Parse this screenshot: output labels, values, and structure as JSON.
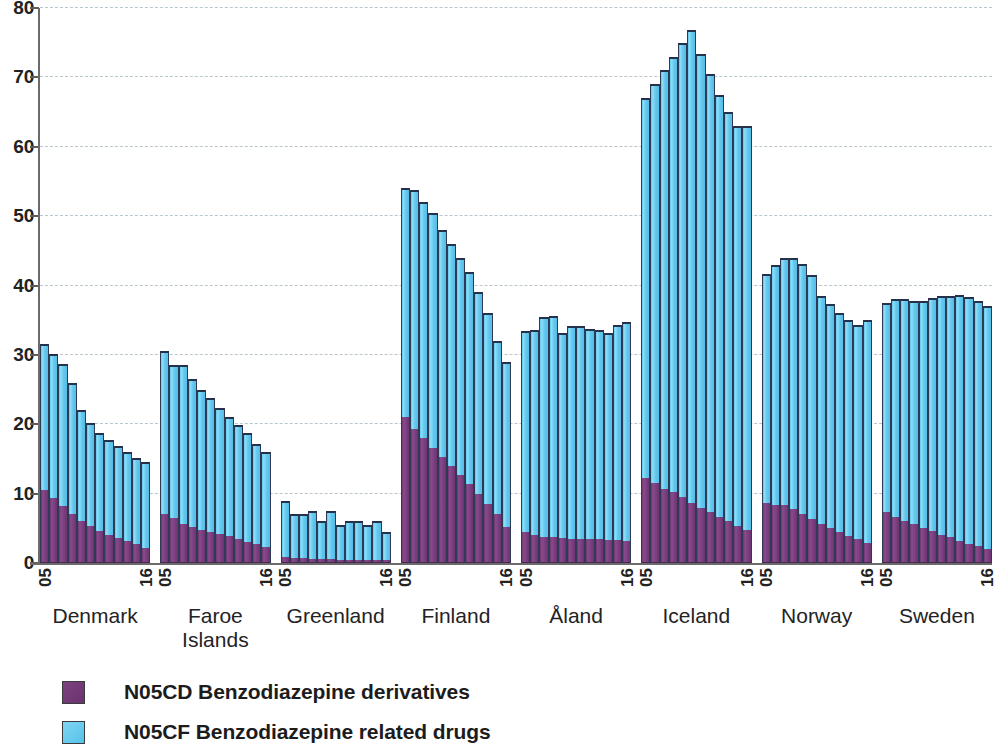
{
  "chart_data": {
    "type": "bar",
    "stacked": true,
    "title": "",
    "subtitle": "",
    "xlabel": "",
    "ylabel": "",
    "ylim": [
      0,
      80
    ],
    "yticks": [
      0,
      10,
      20,
      30,
      40,
      50,
      60,
      70,
      80
    ],
    "ytick_labels": [
      "0",
      "10",
      "20",
      "30",
      "40",
      "50",
      "60",
      "70",
      "80"
    ],
    "grid": true,
    "grid_style": "dashed horizontal",
    "legend_position": "bottom-left",
    "x_tick_labels": [
      "05",
      "16"
    ],
    "years": [
      "05",
      "06",
      "07",
      "08",
      "09",
      "10",
      "11",
      "12",
      "13",
      "14",
      "15",
      "16"
    ],
    "categories": [
      "Denmark",
      "Faroe Islands",
      "Greenland",
      "Finland",
      "Åland",
      "Iceland",
      "Norway",
      "Sweden"
    ],
    "series": [
      {
        "name": "N05CD Benzodiazepine derivatives",
        "color": "#7b3f7e",
        "groups": [
          {
            "category": "Denmark",
            "values": [
              10.5,
              9.4,
              8.2,
              7.0,
              6.0,
              5.3,
              4.6,
              4.1,
              3.6,
              3.2,
              2.7,
              2.2
            ]
          },
          {
            "category": "Faroe Islands",
            "values": [
              7.0,
              6.5,
              5.6,
              5.2,
              4.8,
              4.5,
              4.2,
              3.9,
              3.5,
              3.1,
              2.7,
              2.3
            ]
          },
          {
            "category": "Greenland",
            "values": [
              0.8,
              0.7,
              0.7,
              0.6,
              0.6,
              0.6,
              0.5,
              0.5,
              0.5,
              0.4,
              0.4,
              0.4
            ]
          },
          {
            "category": "Finland",
            "values": [
              21.0,
              19.3,
              18.0,
              16.6,
              15.3,
              14.0,
              12.7,
              11.4,
              10.0,
              8.5,
              7.0,
              5.2
            ]
          },
          {
            "category": "Åland",
            "values": [
              4.4,
              4.0,
              3.8,
              3.7,
              3.6,
              3.5,
              3.5,
              3.4,
              3.4,
              3.3,
              3.3,
              3.2
            ]
          },
          {
            "category": "Iceland",
            "values": [
              12.2,
              11.6,
              10.7,
              10.2,
              9.5,
              8.6,
              8.0,
              7.3,
              6.7,
              6.0,
              5.4,
              4.8
            ]
          },
          {
            "category": "Norway",
            "values": [
              8.6,
              8.4,
              8.4,
              7.8,
              7.0,
              6.3,
              5.6,
              5.0,
              4.4,
              3.9,
              3.4,
              2.9
            ]
          },
          {
            "category": "Sweden",
            "values": [
              7.3,
              6.7,
              6.1,
              5.6,
              5.1,
              4.6,
              4.1,
              3.7,
              3.2,
              2.8,
              2.4,
              2.0
            ]
          }
        ]
      },
      {
        "name": "N05CF Benzodiazepine related drugs",
        "color": "#6ecff0",
        "groups": [
          {
            "category": "Denmark",
            "values": [
              21.0,
              20.7,
              20.5,
              19.0,
              16.0,
              14.9,
              14.2,
              13.7,
              13.2,
              12.8,
              12.4,
              12.3
            ]
          },
          {
            "category": "Faroe Islands",
            "values": [
              23.5,
              22.0,
              22.9,
              21.3,
              20.2,
              19.3,
              18.1,
              17.1,
              16.4,
              15.6,
              14.5,
              13.7
            ]
          },
          {
            "category": "Greenland",
            "values": [
              8.2,
              6.3,
              6.3,
              6.9,
              5.4,
              6.9,
              5.0,
              5.5,
              5.5,
              5.1,
              5.6,
              4.1
            ]
          },
          {
            "category": "Finland",
            "values": [
              33.0,
              34.4,
              34.0,
              33.9,
              32.7,
              32.0,
              31.3,
              30.6,
              29.0,
              27.5,
              25.0,
              23.8
            ]
          },
          {
            "category": "Åland",
            "values": [
              29.1,
              29.6,
              31.7,
              31.9,
              29.6,
              30.6,
              30.7,
              30.4,
              30.2,
              29.8,
              31.0,
              31.6
            ]
          },
          {
            "category": "Iceland",
            "values": [
              54.8,
              57.4,
              60.3,
              62.7,
              65.5,
              68.2,
              65.3,
              63.2,
              60.8,
              59.0,
              57.6,
              58.2
            ]
          },
          {
            "category": "Norway",
            "values": [
              33.0,
              34.6,
              35.6,
              36.2,
              36.1,
              35.2,
              32.9,
              32.3,
              31.6,
              31.1,
              30.9,
              32.1
            ]
          },
          {
            "category": "Sweden",
            "values": [
              30.2,
              31.4,
              32.0,
              32.2,
              32.6,
              33.6,
              34.4,
              34.8,
              35.5,
              35.6,
              35.3,
              35.0
            ]
          }
        ]
      }
    ],
    "totals": [
      {
        "category": "Denmark",
        "values": [
          31.5,
          30.1,
          28.7,
          26.0,
          22.0,
          20.2,
          18.8,
          17.8,
          16.8,
          16.0,
          15.1,
          14.5
        ]
      },
      {
        "category": "Faroe Islands",
        "values": [
          30.5,
          28.5,
          28.5,
          26.5,
          25.0,
          23.8,
          22.3,
          21.0,
          19.9,
          18.7,
          17.2,
          16.0
        ]
      },
      {
        "category": "Greenland",
        "values": [
          9.0,
          7.0,
          7.0,
          7.5,
          6.0,
          7.5,
          5.5,
          6.0,
          6.0,
          5.5,
          6.0,
          4.5
        ]
      },
      {
        "category": "Finland",
        "values": [
          54.0,
          53.7,
          52.0,
          50.5,
          48.0,
          46.0,
          44.0,
          42.0,
          39.0,
          36.0,
          32.0,
          29.0
        ]
      },
      {
        "category": "Åland",
        "values": [
          33.5,
          33.6,
          35.5,
          35.6,
          33.2,
          34.1,
          34.2,
          33.8,
          33.6,
          33.1,
          34.3,
          34.8
        ]
      },
      {
        "category": "Iceland",
        "values": [
          67.0,
          69.0,
          71.0,
          72.9,
          75.0,
          76.8,
          73.3,
          70.5,
          67.5,
          65.0,
          63.0,
          63.0
        ]
      },
      {
        "category": "Norway",
        "values": [
          41.6,
          43.0,
          44.0,
          44.0,
          43.1,
          41.5,
          38.5,
          37.3,
          36.0,
          35.0,
          34.3,
          35.0
        ]
      },
      {
        "category": "Sweden",
        "values": [
          37.5,
          38.1,
          38.1,
          37.8,
          37.7,
          38.2,
          38.5,
          38.5,
          38.7,
          38.4,
          37.7,
          37.0
        ]
      }
    ]
  },
  "axis": {
    "y_labels": [
      "80",
      "70",
      "60",
      "50",
      "40",
      "30",
      "20",
      "10",
      "0"
    ]
  },
  "x_axis": {
    "start_label": "05",
    "end_label": "16"
  },
  "countries": [
    {
      "name": "Denmark"
    },
    {
      "name": "Faroe\nIslands"
    },
    {
      "name": "Greenland"
    },
    {
      "name": "Finland"
    },
    {
      "name": "Åland"
    },
    {
      "name": "Iceland"
    },
    {
      "name": "Norway"
    },
    {
      "name": "Sweden"
    }
  ],
  "legend": {
    "items": [
      {
        "label": "N05CD Benzodiazepine derivatives",
        "color": "#7b3f7e",
        "swatch": "purple"
      },
      {
        "label": "N05CF Benzodiazepine related drugs",
        "color": "#6ecff0",
        "swatch": "blue"
      }
    ]
  }
}
